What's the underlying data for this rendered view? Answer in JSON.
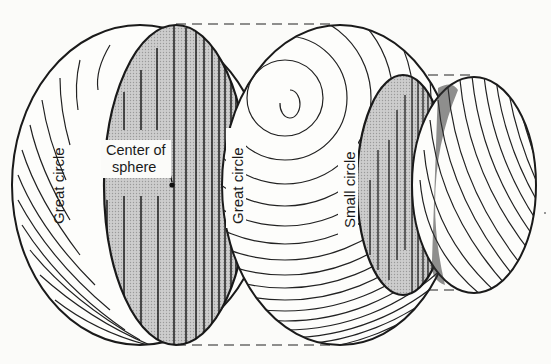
{
  "diagram": {
    "type": "sphere-sections",
    "labels": {
      "great_circle_left": "Great circle",
      "great_circle_right": "Great circle",
      "small_circle": "Small circle",
      "center_line1": "Center of",
      "center_line2": "sphere"
    },
    "colors": {
      "background": "#fbfbf9",
      "section_fill": "#c4c4c4",
      "stroke": "#1a1a1a"
    }
  }
}
